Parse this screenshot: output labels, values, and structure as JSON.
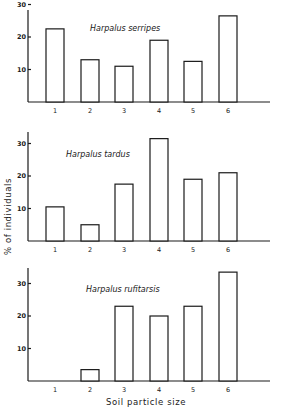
{
  "chart_data": [
    {
      "type": "bar",
      "title": "Harpalus serripes",
      "categories": [
        "1",
        "2",
        "3",
        "4",
        "5",
        "6"
      ],
      "values": [
        22.5,
        13,
        11,
        19,
        12.5,
        26.5
      ],
      "xlabel": "",
      "ylabel": "",
      "yticks": [
        10,
        20,
        30
      ],
      "ylim": [
        0,
        30
      ],
      "grid": false,
      "legend": null
    },
    {
      "type": "bar",
      "title": "Harpalus tardus",
      "categories": [
        "1",
        "2",
        "3",
        "4",
        "5",
        "6"
      ],
      "values": [
        10.5,
        5,
        17.5,
        31.5,
        19,
        21
      ],
      "xlabel": "",
      "ylabel": "% of individuals",
      "yticks": [
        10,
        20,
        30
      ],
      "ylim": [
        0,
        35
      ],
      "grid": false,
      "legend": null
    },
    {
      "type": "bar",
      "title": "Harpalus rufitarsis",
      "categories": [
        "1",
        "2",
        "3",
        "4",
        "5",
        "6"
      ],
      "values": [
        0,
        3.5,
        23,
        20,
        23,
        33.5
      ],
      "xlabel": "Soil particle size",
      "ylabel": "",
      "yticks": [
        10,
        20,
        30
      ],
      "ylim": [
        0,
        35
      ],
      "grid": false,
      "legend": null
    }
  ],
  "figure": {
    "ylabel": "% of individuals",
    "xlabel": "Soil particle size"
  }
}
